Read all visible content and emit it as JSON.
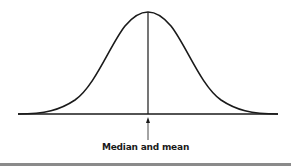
{
  "diagram": {
    "type": "normal-distribution-curve",
    "annotation_label": "Median and mean",
    "colors": {
      "stroke": "#1a1a1a",
      "background": "#ffffff",
      "bottom_rule": "#8a8a8a"
    }
  }
}
